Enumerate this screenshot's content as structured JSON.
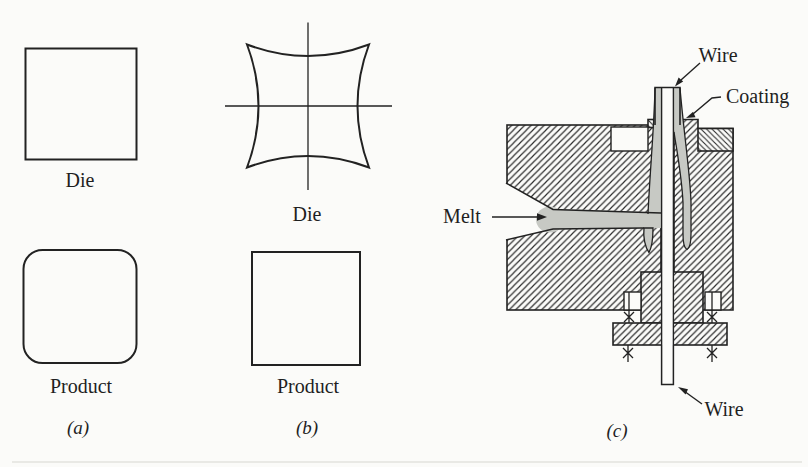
{
  "figure": {
    "colors": {
      "background": "#fbfbf9",
      "ink": "#222222",
      "melt": "#c7c9c4"
    },
    "panel_a": {
      "die_label": "Die",
      "product_label": "Product",
      "caption": "(a)"
    },
    "panel_b": {
      "die_label": "Die",
      "product_label": "Product",
      "caption": "(b)"
    },
    "panel_c": {
      "wire_top_label": "Wire",
      "coating_label": "Coating",
      "melt_label": "Melt",
      "wire_bottom_label": "Wire",
      "caption": "(c)"
    }
  }
}
